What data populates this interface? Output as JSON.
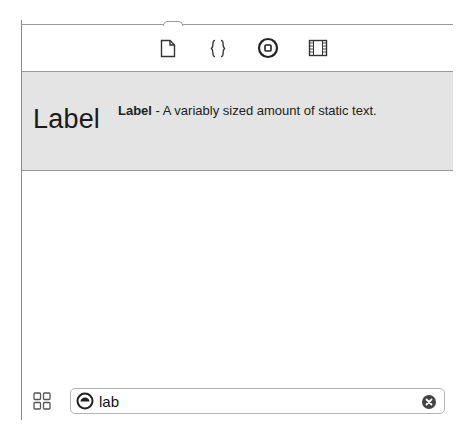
{
  "tabbar": {
    "tabs": [
      {
        "name": "file-template-icon"
      },
      {
        "name": "code-snippet-icon"
      },
      {
        "name": "object-library-icon",
        "selected": true
      },
      {
        "name": "media-library-icon"
      }
    ]
  },
  "library": {
    "items": [
      {
        "title": "Label",
        "name": "Label",
        "description": " - A variably sized amount of static text."
      }
    ]
  },
  "bottom_bar": {
    "view_toggle_icon": "grid-icon",
    "search": {
      "value": "lab",
      "filter_icon": "filter-icon",
      "clear_icon": "clear-icon"
    }
  },
  "colors": {
    "band_bg": "#e4e4e4",
    "border": "#9a9a9a"
  }
}
